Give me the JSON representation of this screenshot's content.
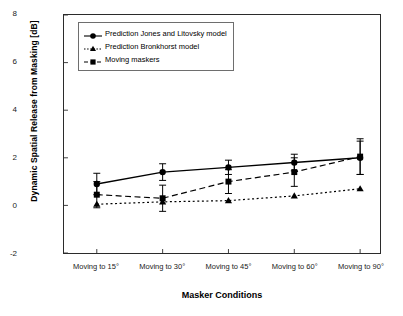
{
  "chart_data": {
    "type": "line",
    "title": "",
    "xlabel": "Masker Conditions",
    "ylabel": "Dynamic Spatial Release from Masking [dB]",
    "categories": [
      "Moving to 15°",
      "Moving to 30°",
      "Moving to 45°",
      "Moving to 60°",
      "Moving to 90°"
    ],
    "ylim": [
      -2,
      8
    ],
    "yticks": [
      "-2",
      "0",
      "2",
      "4",
      "6",
      "8"
    ],
    "grid": false,
    "legend_position": "top-left",
    "series": [
      {
        "name": "Prediction Jones and Litovsky model",
        "marker": "circle",
        "line": "solid",
        "values": [
          0.9,
          1.4,
          1.6,
          1.8,
          2.0
        ],
        "err_up": [
          0.45,
          0.35,
          0.3,
          0.35,
          0.7
        ],
        "err_down": [
          0.45,
          0.35,
          0.3,
          0.35,
          0.7
        ]
      },
      {
        "name": "Prediction Bronkhorst model",
        "marker": "triangle",
        "line": "dotted",
        "values": [
          0.05,
          0.15,
          0.2,
          0.4,
          0.7
        ],
        "err_up": [
          0.0,
          0.0,
          0.0,
          0.0,
          0.0
        ],
        "err_down": [
          0.0,
          0.0,
          0.0,
          0.0,
          0.0
        ]
      },
      {
        "name": "Moving maskers",
        "marker": "square",
        "line": "dashed",
        "values": [
          0.45,
          0.3,
          1.0,
          1.4,
          2.05
        ],
        "err_up": [
          0.55,
          0.55,
          0.5,
          0.6,
          0.75
        ],
        "err_down": [
          0.55,
          0.55,
          0.5,
          0.6,
          0.75
        ]
      }
    ]
  },
  "axis": {
    "yticks": [
      "-2",
      "0",
      "2",
      "4",
      "6",
      "8"
    ],
    "xlabel": "Masker Conditions",
    "ylabel": "Dynamic Spatial Release from Masking [dB]",
    "xticks": [
      "Moving to 15°",
      "Moving to 30°",
      "Moving to 45°",
      "Moving to 60°",
      "Moving to 90°"
    ]
  },
  "legend": {
    "items": [
      {
        "label": "Prediction Jones and Litovsky model",
        "marker": "circle-marker"
      },
      {
        "label": "Prediction Bronkhorst model",
        "marker": "triangle-marker"
      },
      {
        "label": "Moving maskers",
        "marker": "square-marker"
      }
    ]
  },
  "colors": {
    "ink": "#000000",
    "axis": "#2b2b2b",
    "background": "#ffffff"
  }
}
